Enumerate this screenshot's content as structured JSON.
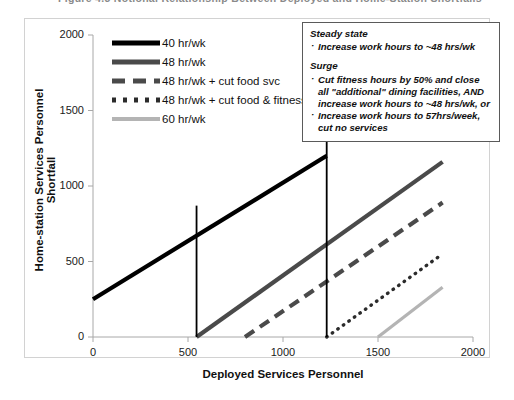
{
  "title_partial": "Figure 4.3   Notional Relationship Between Deployed and Home-Station Shortfalls",
  "axes": {
    "x_label": "Deployed Services Personnel",
    "y_label": "Home-station Services Personnel Shortfall",
    "x_ticks": [
      "0",
      "500",
      "1000",
      "1500",
      "2000"
    ],
    "y_ticks": [
      "0",
      "500",
      "1000",
      "1500",
      "2000"
    ]
  },
  "legend": {
    "items": [
      {
        "label": "40 hr/wk",
        "key": "solid-black"
      },
      {
        "label": "48 hr/wk",
        "key": "solid-dark-gray"
      },
      {
        "label": "48 hr/wk + cut food svc",
        "key": "dashed-gray"
      },
      {
        "label": "48 hr/wk + cut food & fitness",
        "key": "dotted-black"
      },
      {
        "label": "60 hr/wk",
        "key": "solid-light-gray"
      }
    ]
  },
  "callout": {
    "heading_1": "Steady state",
    "bullets_1": [
      "Increase work hours to ~48 hrs/wk"
    ],
    "heading_2": "Surge",
    "bullets_2": [
      "Cut fitness hours by 50% and close all \"additional\" dining facilities, AND increase work hours to ~48 hrs/wk, or",
      "Increase work hours to 57hrs/week, cut no services"
    ]
  },
  "colors": {
    "line_40": "#000000",
    "line_48": "#4a4a4a",
    "line_48_food": "#4a4a4a",
    "line_48_food_fitness": "#2b2b2b",
    "line_60": "#b4b4b4",
    "vertical_marker": "#000000",
    "axis": "#9a9a9a",
    "frame": "#d2d2d2"
  },
  "chart_data": {
    "type": "line",
    "title": "Notional Relationship Between Deployed and Home-Station Shortfalls",
    "xlabel": "Deployed Services Personnel",
    "ylabel": "Home-station Services Personnel Shortfall",
    "xlim": [
      0,
      2000
    ],
    "ylim": [
      0,
      2000
    ],
    "xticks": [
      0,
      500,
      1000,
      1500,
      2000
    ],
    "yticks": [
      0,
      500,
      1000,
      1500,
      2000
    ],
    "grid": false,
    "legend_position": "upper-left-inside",
    "series": [
      {
        "name": "40 hr/wk",
        "style": "solid",
        "color": "#000000",
        "x": [
          0,
          1230
        ],
        "y": [
          250,
          1200
        ]
      },
      {
        "name": "48 hr/wk",
        "style": "solid",
        "color": "#4a4a4a",
        "x": [
          545,
          1840
        ],
        "y": [
          0,
          1160
        ]
      },
      {
        "name": "48 hr/wk + cut food svc",
        "style": "dashed",
        "color": "#4a4a4a",
        "x": [
          800,
          1840
        ],
        "y": [
          0,
          890
        ]
      },
      {
        "name": "48 hr/wk + cut food & fitness",
        "style": "dotted",
        "color": "#2b2b2b",
        "x": [
          1230,
          1840
        ],
        "y": [
          0,
          550
        ]
      },
      {
        "name": "60 hr/wk",
        "style": "solid",
        "color": "#b4b4b4",
        "x": [
          1500,
          1840
        ],
        "y": [
          0,
          330
        ]
      }
    ],
    "vertical_markers": [
      {
        "x": 545,
        "y_top": 870,
        "y_bottom": 0
      },
      {
        "x": 1230,
        "y_top": 2000,
        "y_bottom": 0
      }
    ]
  }
}
